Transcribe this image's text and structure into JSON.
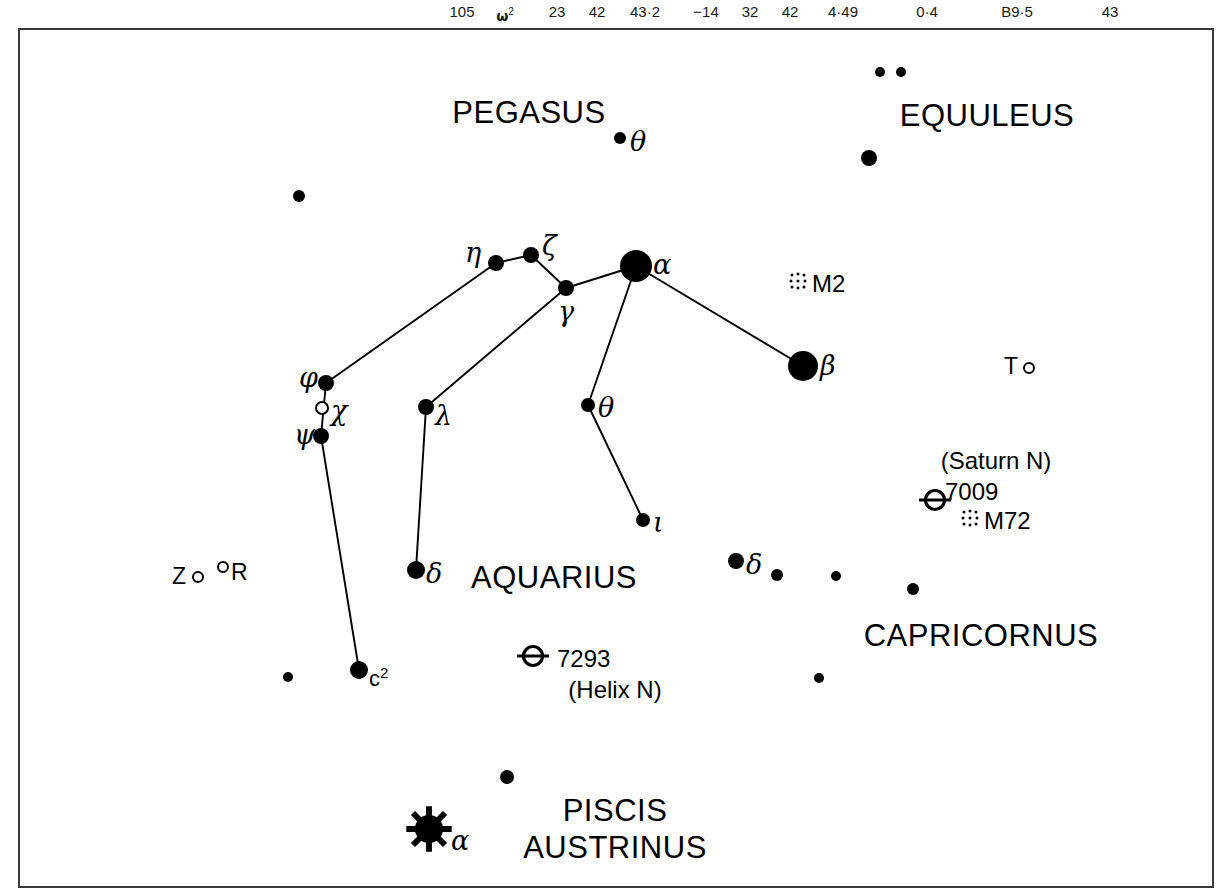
{
  "page": {
    "width": 1232,
    "height": 895,
    "background": "#ffffff",
    "ink": "#000000",
    "frame_color": "#3a3a3a"
  },
  "header": {
    "cells": [
      {
        "text": "105",
        "x": 462
      },
      {
        "text": "ω",
        "sup": "2",
        "x": 505,
        "greek": true
      },
      {
        "text": "23",
        "x": 557
      },
      {
        "text": "42",
        "x": 597
      },
      {
        "text": "43·2",
        "x": 645
      },
      {
        "text": "−14",
        "x": 706
      },
      {
        "text": "32",
        "x": 750
      },
      {
        "text": "42",
        "x": 790
      },
      {
        "text": "4·49",
        "x": 843
      },
      {
        "text": "0·4",
        "x": 927
      },
      {
        "text": "B9·5",
        "x": 1017
      },
      {
        "text": "43",
        "x": 1110
      }
    ]
  },
  "chart_data": {
    "type": "star-chart",
    "frame": {
      "x": 18,
      "y": 28,
      "width": 1196,
      "height": 860
    },
    "constellation_names": [
      {
        "name": "PEGASUS",
        "x": 527,
        "y": 111,
        "lines": [
          "PEGASUS"
        ]
      },
      {
        "name": "EQUULEUS",
        "x": 985,
        "y": 114,
        "lines": [
          "EQUULEUS"
        ]
      },
      {
        "name": "AQUARIUS",
        "x": 552,
        "y": 576,
        "lines": [
          "AQUARIUS"
        ]
      },
      {
        "name": "CAPRICORNUS",
        "x": 979,
        "y": 634,
        "lines": [
          "CAPRICORNUS"
        ]
      },
      {
        "name": "PISCIS AUSTRINUS",
        "x": 613,
        "y": 827,
        "lines": [
          "PISCIS",
          "AUSTRINUS"
        ]
      }
    ],
    "stars": [
      {
        "id": "peg-theta",
        "x": 618,
        "y": 136,
        "r": 6,
        "type": "filled",
        "label": "θ",
        "label_kind": "greek",
        "lx": 628,
        "ly": 139
      },
      {
        "id": "peg-field-1",
        "x": 297,
        "y": 194,
        "r": 6,
        "type": "filled"
      },
      {
        "id": "equ-field-1",
        "x": 878,
        "y": 70,
        "r": 5,
        "type": "filled"
      },
      {
        "id": "equ-field-2",
        "x": 899,
        "y": 70,
        "r": 5,
        "type": "filled"
      },
      {
        "id": "equ-alpha",
        "x": 867,
        "y": 156,
        "r": 8,
        "type": "filled"
      },
      {
        "id": "aqr-eta",
        "x": 494,
        "y": 261,
        "r": 8,
        "type": "filled",
        "label": "η",
        "label_kind": "greek",
        "lx": 463,
        "ly": 250
      },
      {
        "id": "aqr-zeta",
        "x": 529,
        "y": 253,
        "r": 8,
        "type": "filled",
        "label": "ζ",
        "label_kind": "greek",
        "lx": 540,
        "ly": 243
      },
      {
        "id": "aqr-gamma",
        "x": 564,
        "y": 286,
        "r": 8,
        "type": "filled",
        "label": "γ",
        "label_kind": "greek",
        "lx": 556,
        "ly": 309
      },
      {
        "id": "aqr-alpha",
        "x": 634,
        "y": 264,
        "r": 16,
        "type": "filled",
        "label": "α",
        "label_kind": "greek",
        "lx": 651,
        "ly": 262
      },
      {
        "id": "aqr-beta",
        "x": 801,
        "y": 364,
        "r": 15,
        "type": "filled",
        "label": "β",
        "label_kind": "greek",
        "lx": 818,
        "ly": 363
      },
      {
        "id": "aqr-phi",
        "x": 324,
        "y": 381,
        "r": 8,
        "type": "filled",
        "label": "φ",
        "label_kind": "greek",
        "lx": 297,
        "ly": 375
      },
      {
        "id": "aqr-chi",
        "x": 320,
        "y": 406,
        "r": 7,
        "type": "open",
        "label": "χ",
        "label_kind": "greek",
        "lx": 329,
        "ly": 408
      },
      {
        "id": "aqr-psi",
        "x": 319,
        "y": 434,
        "r": 8,
        "type": "filled",
        "label": "ψ",
        "label_kind": "greek",
        "lx": 292,
        "ly": 432
      },
      {
        "id": "aqr-lambda",
        "x": 424,
        "y": 405,
        "r": 8,
        "type": "filled",
        "label": "λ",
        "label_kind": "greek",
        "lx": 433,
        "ly": 413
      },
      {
        "id": "aqr-theta",
        "x": 586,
        "y": 403,
        "r": 7,
        "type": "filled",
        "label": "θ",
        "label_kind": "greek",
        "lx": 596,
        "ly": 405
      },
      {
        "id": "aqr-iota",
        "x": 641,
        "y": 518,
        "r": 7,
        "type": "filled",
        "label": "ι",
        "label_kind": "greek",
        "lx": 651,
        "ly": 520
      },
      {
        "id": "aqr-delta",
        "x": 414,
        "y": 568,
        "r": 9,
        "type": "filled",
        "label": "δ",
        "label_kind": "greek",
        "lx": 424,
        "ly": 571
      },
      {
        "id": "aqr-c2",
        "x": 357,
        "y": 668,
        "r": 9,
        "type": "filled",
        "label": "c",
        "label_sup": "2",
        "label_kind": "latin",
        "lx": 367,
        "ly": 674
      },
      {
        "id": "aqr-field-1",
        "x": 286,
        "y": 675,
        "r": 5,
        "type": "filled"
      },
      {
        "id": "cap-delta",
        "x": 734,
        "y": 559,
        "r": 8,
        "type": "filled",
        "label": "δ",
        "label_kind": "greek",
        "lx": 744,
        "ly": 562
      },
      {
        "id": "cap-field-1",
        "x": 775,
        "y": 573,
        "r": 6,
        "type": "filled"
      },
      {
        "id": "cap-field-2",
        "x": 834,
        "y": 574,
        "r": 5,
        "type": "filled"
      },
      {
        "id": "cap-field-3",
        "x": 911,
        "y": 587,
        "r": 6,
        "type": "filled"
      },
      {
        "id": "cap-field-4",
        "x": 817,
        "y": 676,
        "r": 5,
        "type": "filled"
      },
      {
        "id": "psa-field-1",
        "x": 505,
        "y": 775,
        "r": 7,
        "type": "filled"
      },
      {
        "id": "psa-alpha",
        "x": 427,
        "y": 829,
        "r": 14,
        "type": "burst",
        "label": "α",
        "label_kind": "greek",
        "lx": 449,
        "ly": 838
      }
    ],
    "variable_stars": [
      {
        "id": "var-T",
        "label": "T",
        "x": 1027,
        "y": 366,
        "label_x": 1002,
        "label_y": 364,
        "r": 6
      },
      {
        "id": "var-Z",
        "label": "Z",
        "x": 196,
        "y": 575,
        "label_x": 170,
        "label_y": 574,
        "r": 6
      },
      {
        "id": "var-R",
        "label": "R",
        "x": 221,
        "y": 565,
        "label_x": 229,
        "label_y": 570,
        "r": 6
      }
    ],
    "constellation_lines": [
      {
        "from": "aqr-phi",
        "to": "aqr-eta"
      },
      {
        "from": "aqr-eta",
        "to": "aqr-zeta"
      },
      {
        "from": "aqr-zeta",
        "to": "aqr-gamma"
      },
      {
        "from": "aqr-gamma",
        "to": "aqr-alpha"
      },
      {
        "from": "aqr-gamma",
        "to": "aqr-lambda"
      },
      {
        "from": "aqr-alpha",
        "to": "aqr-beta"
      },
      {
        "from": "aqr-alpha",
        "to": "aqr-theta"
      },
      {
        "from": "aqr-theta",
        "to": "aqr-iota"
      },
      {
        "from": "aqr-phi",
        "to": "aqr-psi"
      },
      {
        "from": "aqr-psi",
        "to": "aqr-c2"
      },
      {
        "from": "aqr-lambda",
        "to": "aqr-delta"
      }
    ],
    "deep_sky_objects": [
      {
        "id": "m2",
        "symbol": "globular-cluster",
        "symbol_x": 796,
        "symbol_y": 281,
        "label": "M2",
        "label_x": 810,
        "label_y": 281
      },
      {
        "id": "ngc7009",
        "symbol": "planetary-nebula",
        "symbol_x": 933,
        "symbol_y": 500,
        "label": "7009",
        "label_x": 943,
        "label_y": 489,
        "note": "(Saturn N)",
        "note_x": 994,
        "note_y": 458
      },
      {
        "id": "m72",
        "symbol": "globular-cluster",
        "symbol_x": 968,
        "symbol_y": 518,
        "label": "M72",
        "label_x": 982,
        "label_y": 518
      },
      {
        "id": "ngc7293",
        "symbol": "planetary-nebula",
        "symbol_x": 531,
        "symbol_y": 656,
        "label": "7293",
        "label_x": 555,
        "label_y": 656,
        "note": "(Helix N)",
        "note_x": 613,
        "note_y": 687
      }
    ],
    "legend_notes": {
      "filled_circle": "star, size scaled by magnitude",
      "open_circle": "variable star",
      "burst": "first magnitude star",
      "circle_with_bar": "planetary nebula",
      "stippled_dots": "globular cluster"
    }
  }
}
